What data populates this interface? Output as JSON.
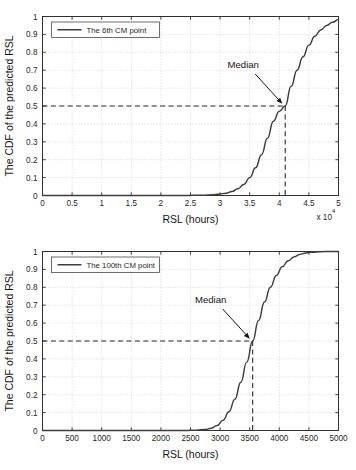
{
  "page": {
    "background_color": "#ffffff",
    "curve_color": "#3d3d3d",
    "grid_color": "#b9b9b9",
    "axis_color": "#303030"
  },
  "chart_data": [
    {
      "id": "top",
      "type": "line",
      "title": "",
      "xlabel": "RSL (hours)",
      "ylabel": "The CDF of the predicted RSL",
      "x_exponent_label": "x 10",
      "x_exponent_power": "4",
      "xlim": [
        0,
        5
      ],
      "ylim": [
        0,
        1
      ],
      "xticks": [
        "0",
        "0.5",
        "1",
        "1.5",
        "2",
        "2.5",
        "3",
        "3.5",
        "4",
        "4.5",
        "5"
      ],
      "xtick_values": [
        0,
        0.5,
        1,
        1.5,
        2,
        2.5,
        3,
        3.5,
        4,
        4.5,
        5
      ],
      "yticks": [
        "0",
        "0.1",
        "0.2",
        "0.3",
        "0.4",
        "0.5",
        "0.6",
        "0.7",
        "0.8",
        "0.9",
        "1"
      ],
      "ytick_values": [
        0,
        0.1,
        0.2,
        0.3,
        0.4,
        0.5,
        0.6,
        0.7,
        0.8,
        0.9,
        1
      ],
      "grid": true,
      "legend": {
        "label": "The 6th CM point",
        "position": "top-left"
      },
      "annotation": {
        "label": "Median",
        "x": 4.1,
        "y": 0.5
      },
      "series": [
        {
          "name": "The 6th CM point",
          "x": [
            0.0,
            0.5,
            1.0,
            1.5,
            2.0,
            2.4,
            2.7,
            2.9,
            3.0,
            3.1,
            3.2,
            3.3,
            3.4,
            3.5,
            3.6,
            3.7,
            3.8,
            3.9,
            4.0,
            4.1,
            4.2,
            4.3,
            4.4,
            4.5,
            4.6,
            4.7,
            4.8,
            4.9,
            5.0
          ],
          "y": [
            0.0,
            0.0,
            0.0,
            0.0,
            0.0,
            0.0,
            0.002,
            0.005,
            0.008,
            0.013,
            0.022,
            0.038,
            0.062,
            0.1,
            0.155,
            0.228,
            0.32,
            0.415,
            0.47,
            0.5,
            0.61,
            0.7,
            0.775,
            0.84,
            0.89,
            0.925,
            0.95,
            0.968,
            0.983
          ]
        }
      ]
    },
    {
      "id": "bottom",
      "type": "line",
      "title": "",
      "xlabel": "RSL (hours)",
      "ylabel": "The CDF of the predicted RSL",
      "x_exponent_label": "",
      "x_exponent_power": "",
      "xlim": [
        0,
        5000
      ],
      "ylim": [
        0,
        1
      ],
      "xticks": [
        "0",
        "500",
        "1000",
        "1500",
        "2000",
        "2500",
        "3000",
        "3500",
        "4000",
        "4500",
        "5000"
      ],
      "xtick_values": [
        0,
        500,
        1000,
        1500,
        2000,
        2500,
        3000,
        3500,
        4000,
        4500,
        5000
      ],
      "yticks": [
        "0",
        "0.1",
        "0.2",
        "0.3",
        "0.4",
        "0.5",
        "0.6",
        "0.7",
        "0.8",
        "0.9",
        "1"
      ],
      "ytick_values": [
        0,
        0.1,
        0.2,
        0.3,
        0.4,
        0.5,
        0.6,
        0.7,
        0.8,
        0.9,
        1
      ],
      "grid": true,
      "legend": {
        "label": "The 100th CM point",
        "position": "top-left"
      },
      "annotation": {
        "label": "Median",
        "x": 3550,
        "y": 0.5
      },
      "series": [
        {
          "name": "The 100th CM point",
          "x": [
            0,
            500,
            1000,
            1500,
            2000,
            2400,
            2600,
            2750,
            2850,
            2950,
            3050,
            3150,
            3250,
            3350,
            3450,
            3550,
            3650,
            3750,
            3850,
            3950,
            4050,
            4150,
            4250,
            4350,
            4450,
            4550,
            4700,
            4850,
            5000
          ],
          "y": [
            0.0,
            0.0,
            0.0,
            0.0,
            0.0,
            0.0,
            0.002,
            0.006,
            0.013,
            0.028,
            0.058,
            0.105,
            0.175,
            0.27,
            0.382,
            0.5,
            0.615,
            0.718,
            0.8,
            0.866,
            0.915,
            0.948,
            0.97,
            0.984,
            0.992,
            0.996,
            0.999,
            1.0,
            1.0
          ]
        }
      ]
    }
  ]
}
